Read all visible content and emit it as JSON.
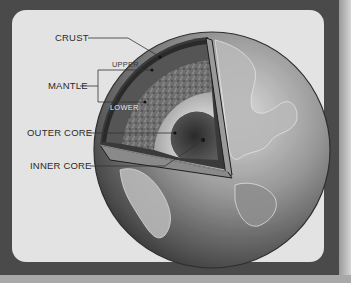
{
  "diagram": {
    "labels": {
      "crust": "CRUST",
      "mantle": "MANTLE",
      "mantle_upper": "UPPER",
      "mantle_lower": "LOWER",
      "outer_core": "OUTER CORE",
      "inner_core": "INNER CORE"
    },
    "colors": {
      "frame": "#4a4a4a",
      "panel": "#e3e3e3",
      "label_text": "#2a2a2a",
      "leader_line": "#333333"
    }
  }
}
